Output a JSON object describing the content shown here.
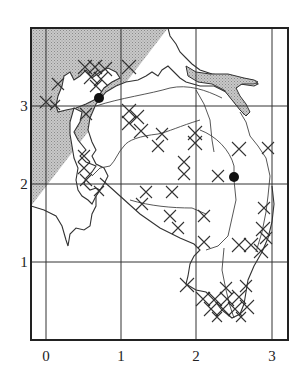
{
  "map": {
    "width": 302,
    "height": 382,
    "frame": {
      "x": 31,
      "y": 28,
      "width": 257,
      "height": 312
    },
    "colors": {
      "sea": "#bdbdbd",
      "land": "#ffffff",
      "line": "#333333",
      "dot": "#111111"
    },
    "x_axis": {
      "ticks": [
        {
          "label": "0",
          "px": 46
        },
        {
          "label": "1",
          "px": 121
        },
        {
          "label": "2",
          "px": 196
        },
        {
          "label": "3",
          "px": 272
        }
      ]
    },
    "y_axis": {
      "ticks": [
        {
          "label": "1",
          "px": 262
        },
        {
          "label": "2",
          "px": 184
        },
        {
          "label": "3",
          "px": 106
        }
      ]
    },
    "markers": [
      {
        "name": "location-1",
        "x": 99,
        "y": 98,
        "coord": [
          0.7,
          3.1
        ]
      },
      {
        "name": "location-2",
        "x": 234,
        "y": 177,
        "coord": [
          2.5,
          2.1
        ]
      }
    ],
    "legend_symbols": {
      "hatched_cross": "x-mark",
      "shaded": "sea-stipple",
      "dot": "site"
    }
  }
}
